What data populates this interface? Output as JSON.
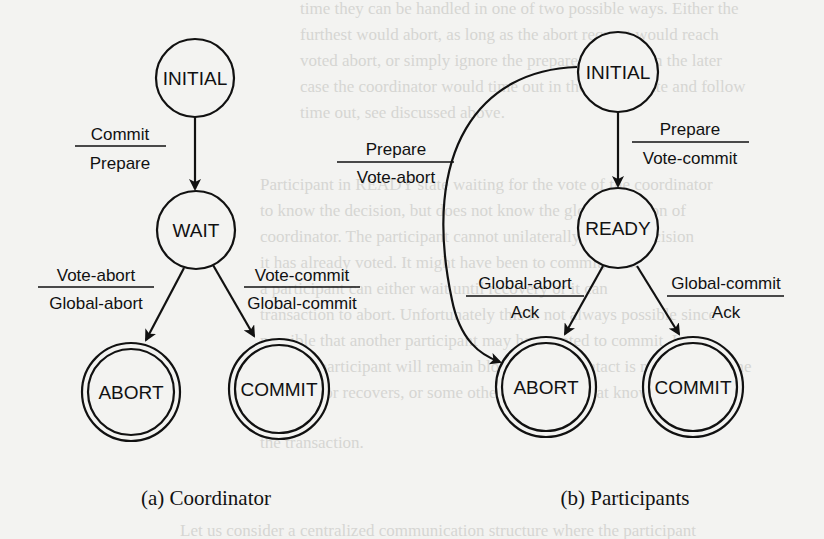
{
  "figure": {
    "coordinator": {
      "caption": "(a) Coordinator",
      "states": {
        "initial": "INITIAL",
        "wait": "WAIT",
        "abort": "ABORT",
        "commit": "COMMIT"
      },
      "transitions": [
        {
          "from": "INITIAL",
          "to": "WAIT",
          "event": "Commit",
          "action": "Prepare"
        },
        {
          "from": "WAIT",
          "to": "ABORT",
          "event": "Vote-abort",
          "action": "Global-abort"
        },
        {
          "from": "WAIT",
          "to": "COMMIT",
          "event": "Vote-commit",
          "action": "Global-commit"
        }
      ]
    },
    "participants": {
      "caption": "(b) Participants",
      "states": {
        "initial": "INITIAL",
        "ready": "READY",
        "abort": "ABORT",
        "commit": "COMMIT"
      },
      "transitions": [
        {
          "from": "INITIAL",
          "to": "ABORT",
          "event": "Prepare",
          "action": "Vote-abort"
        },
        {
          "from": "INITIAL",
          "to": "READY",
          "event": "Prepare",
          "action": "Vote-commit"
        },
        {
          "from": "READY",
          "to": "ABORT",
          "event": "Global-abort",
          "action": "Ack"
        },
        {
          "from": "READY",
          "to": "COMMIT",
          "event": "Global-commit",
          "action": "Ack"
        }
      ]
    }
  },
  "background_text": [
    "time they can be handled in one of two possible ways. Either the",
    "furthest would abort, as long as the abort request would reach",
    "voted abort, or simply ignore the prepare message. In the later",
    "case the coordinator would time out in the WAIT state and follow",
    "time out, see discussed above.",
    "Participant in READY state waiting for the vote of the coordinator",
    "to know the decision, but does not know the global decision of",
    "coordinator. The participant cannot unilaterally make a decision",
    "it has already voted. It might have been to commit, or it",
    "a participant can either wait until recovery or it can",
    "transaction to abort. Unfortunately this is not always possible since",
    "possible that another participant may have voted to commit. In",
    "case the participant will remain blocked until contact is made with some",
    "coordinator recovers, or some other participant that knows",
    "the transaction.",
    "Let us consider a centralized communication structure where the participant"
  ]
}
